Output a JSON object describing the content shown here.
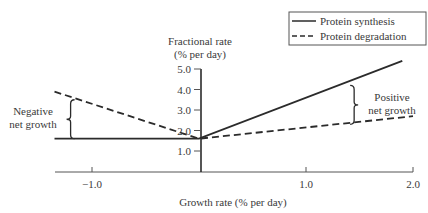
{
  "chart_data": {
    "type": "line",
    "title": "",
    "xlabel": "Growth rate (% per day)",
    "ylabel": "Fractional rate\n(% per day)",
    "ylabel_lines": [
      "Fractional rate",
      "(% per day)"
    ],
    "xlim": [
      -1.35,
      2.0
    ],
    "ylim": [
      0,
      5.0
    ],
    "x_ticks": [
      -1.0,
      1.0,
      2.0
    ],
    "x_tick_labels": [
      "−1.0",
      "1.0",
      "2.0"
    ],
    "y_ticks": [
      1.0,
      2.0,
      3.0,
      4.0,
      5.0
    ],
    "y_tick_labels": [
      "1.0",
      "2.0",
      "3.0",
      "4.0",
      "5.0"
    ],
    "grid": false,
    "legend": {
      "position": "top-right",
      "entries": [
        "Protein synthesis",
        "Protein degradation"
      ]
    },
    "series": [
      {
        "name": "Protein synthesis",
        "style": "solid",
        "points": [
          [
            -1.35,
            1.6
          ],
          [
            0,
            1.6
          ],
          [
            1.9,
            5.4
          ]
        ]
      },
      {
        "name": "Protein degradation",
        "style": "dashed",
        "points": [
          [
            -1.35,
            3.9
          ],
          [
            0,
            1.6
          ],
          [
            2.0,
            2.7
          ]
        ]
      }
    ],
    "annotations": [
      {
        "text_lines": [
          "Negative",
          "net growth"
        ],
        "brace_x": -1.2,
        "brace_y": [
          1.6,
          3.5
        ]
      },
      {
        "text_lines": [
          "Positive",
          "net growth"
        ],
        "brace_x": 1.45,
        "brace_y": [
          2.3,
          4.2
        ]
      }
    ]
  },
  "colors": {
    "line": "#2b2b2b",
    "text": "#3a3a3a"
  }
}
